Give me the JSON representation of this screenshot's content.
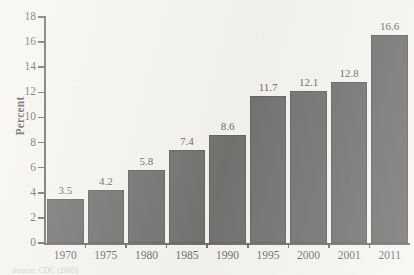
{
  "chart_data": {
    "type": "bar",
    "title": "",
    "xlabel": "",
    "ylabel": "Percent",
    "categories": [
      "1970",
      "1975",
      "1980",
      "1985",
      "1990",
      "1995",
      "2000",
      "2001",
      "2011"
    ],
    "values": [
      3.5,
      4.2,
      5.8,
      7.4,
      8.6,
      11.7,
      12.1,
      12.8,
      16.6
    ],
    "value_labels": [
      "3.5",
      "4.2",
      "5.8",
      "7.4",
      "8.6",
      "11.7",
      "12.1",
      "12.8",
      "16.6"
    ],
    "ylim": [
      0,
      18
    ],
    "ytick_values": [
      0,
      2,
      4,
      6,
      8,
      10,
      12,
      14,
      16,
      18
    ],
    "ytick_labels": [
      "0",
      "2",
      "4",
      "6",
      "8",
      "10",
      "12",
      "14",
      "16",
      "18"
    ],
    "grid": false,
    "legend": false,
    "bar_color": "#2f2f2f",
    "axis_color": "#2b2b2b",
    "background": "#f3f1ec"
  },
  "figure": {
    "source_note": "Source: CDC (2005)"
  }
}
